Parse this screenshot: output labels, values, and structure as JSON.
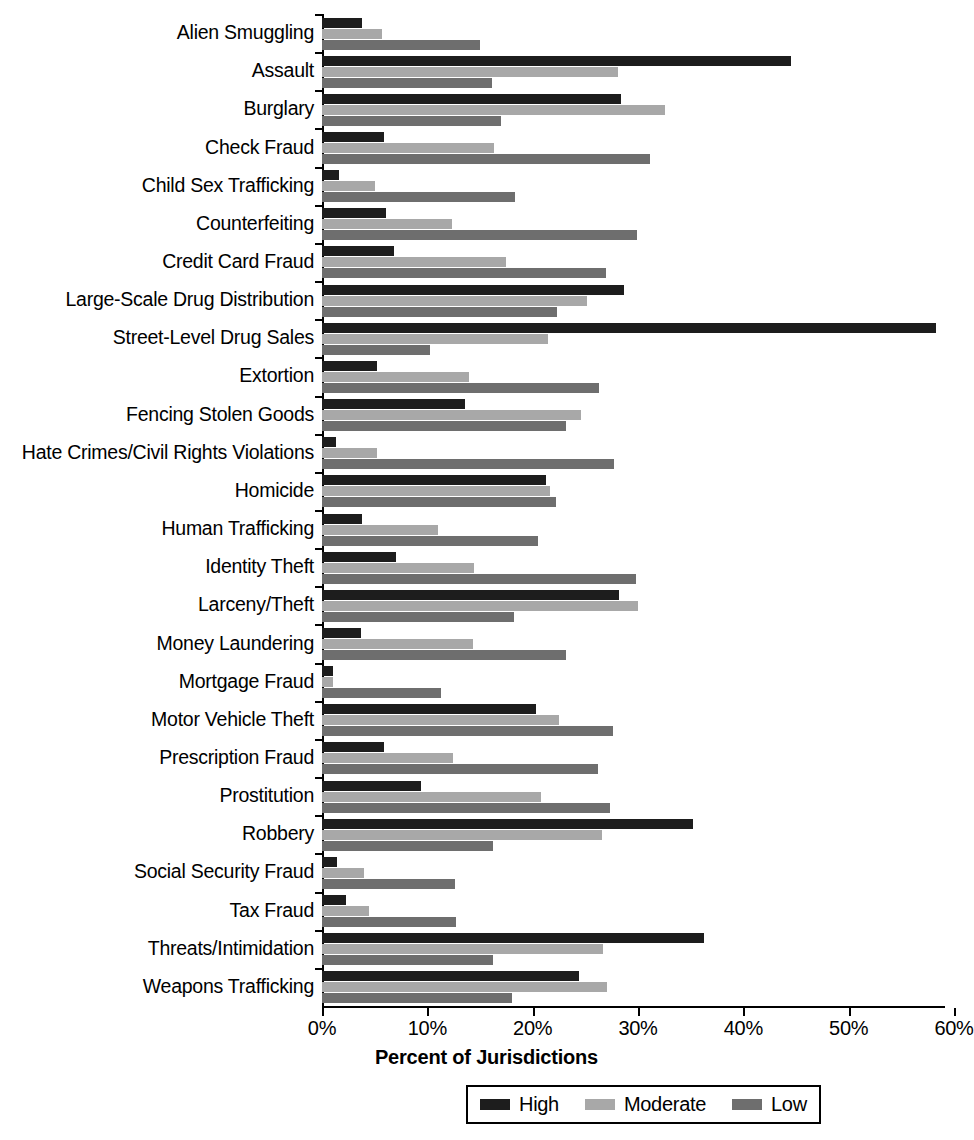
{
  "chart_data": {
    "type": "bar",
    "orientation": "horizontal",
    "title": "",
    "xlabel": "Percent of Jurisdictions",
    "ylabel": "",
    "xlim": [
      0,
      60
    ],
    "xticks": [
      "0%",
      "10%",
      "20%",
      "30%",
      "40%",
      "50%",
      "60%"
    ],
    "xtick_values": [
      0,
      10,
      20,
      30,
      40,
      50,
      60
    ],
    "grid": false,
    "legend_position": "bottom-center",
    "categories": [
      "Alien Smuggling",
      "Assault",
      "Burglary",
      "Check Fraud",
      "Child Sex Trafficking",
      "Counterfeiting",
      "Credit Card Fraud",
      "Large-Scale Drug Distribution",
      "Street-Level Drug Sales",
      "Extortion",
      "Fencing Stolen Goods",
      "Hate Crimes/Civil Rights Violations",
      "Homicide",
      "Human Trafficking",
      "Identity Theft",
      "Larceny/Theft",
      "Money Laundering",
      "Mortgage Fraud",
      "Motor Vehicle Theft",
      "Prescription Fraud",
      "Prostitution",
      "Robbery",
      "Social Security Fraud",
      "Tax Fraud",
      "Threats/Intimidation",
      "Weapons Trafficking"
    ],
    "series": [
      {
        "name": "High",
        "color": "#1d1d1d",
        "values": [
          3.8,
          44.5,
          28.4,
          5.9,
          1.6,
          6.1,
          6.8,
          28.7,
          58.3,
          5.2,
          13.6,
          1.3,
          21.3,
          3.8,
          7.0,
          28.2,
          3.7,
          1.0,
          20.3,
          5.9,
          9.4,
          35.2,
          1.4,
          2.3,
          36.3,
          24.4
        ]
      },
      {
        "name": "Moderate",
        "color": "#a8a8a8",
        "values": [
          5.7,
          28.1,
          32.6,
          16.3,
          5.0,
          12.3,
          17.5,
          25.2,
          21.5,
          14.0,
          24.6,
          5.2,
          21.6,
          11.0,
          14.4,
          30.0,
          14.3,
          1.0,
          22.5,
          12.4,
          20.8,
          26.6,
          4.0,
          4.5,
          26.7,
          27.1
        ]
      },
      {
        "name": "Low",
        "color": "#6e6e6e",
        "values": [
          15.0,
          16.1,
          17.0,
          31.1,
          18.3,
          29.9,
          27.0,
          22.3,
          10.3,
          26.3,
          23.2,
          27.7,
          22.2,
          20.5,
          29.8,
          18.2,
          23.2,
          11.3,
          27.6,
          26.2,
          27.3,
          16.2,
          12.6,
          12.7,
          16.2,
          18.0
        ]
      }
    ]
  },
  "axis_title": "Percent of Jurisdictions",
  "legend": {
    "entries": [
      {
        "label": "High",
        "swatch": "high-swatch-icon"
      },
      {
        "label": "Moderate",
        "swatch": "moderate-swatch-icon"
      },
      {
        "label": "Low",
        "swatch": "low-swatch-icon"
      }
    ]
  }
}
